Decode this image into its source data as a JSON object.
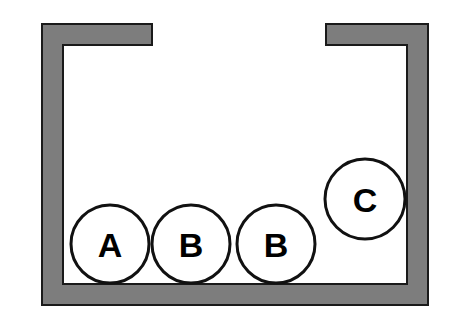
{
  "figure": {
    "background_color": "#ffffff",
    "width": 452,
    "height": 332,
    "container": {
      "name": "container",
      "wall_fill_color": "#7d7d7d",
      "wall_stroke_color": "#1a1a1a",
      "wall_stroke_width": 2,
      "wall_thickness": 21,
      "outer_left": 42,
      "outer_right": 428,
      "outer_top": 24,
      "outer_bottom": 305,
      "inner_left": 63,
      "inner_right": 407,
      "inner_floor_top": 284,
      "opening": {
        "left_lip_end_x": 152,
        "right_lip_start_x": 326,
        "lip_top_y": 24,
        "lip_bottom_y": 45,
        "gap_width": 174
      }
    },
    "balls": [
      {
        "label": "A",
        "cx": 110,
        "cy": 244,
        "r": 39,
        "fill": "#ffffff",
        "stroke": "#111111",
        "stroke_width": 3,
        "resting": "floor"
      },
      {
        "label": "B",
        "cx": 191,
        "cy": 244,
        "r": 39,
        "fill": "#ffffff",
        "stroke": "#111111",
        "stroke_width": 3,
        "resting": "floor"
      },
      {
        "label": "B",
        "cx": 276,
        "cy": 244,
        "r": 39,
        "fill": "#ffffff",
        "stroke": "#111111",
        "stroke_width": 3,
        "resting": "floor"
      },
      {
        "label": "C",
        "cx": 365,
        "cy": 199,
        "r": 40,
        "fill": "#ffffff",
        "stroke": "#111111",
        "stroke_width": 3,
        "resting": "stacked"
      }
    ]
  }
}
